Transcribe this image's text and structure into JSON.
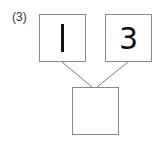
{
  "problem": {
    "label": "(3)",
    "top_left_value": "1",
    "top_right_value": "3",
    "bottom_value": ""
  },
  "colors": {
    "border": "#8a8a8a",
    "line": "#7a7a7a",
    "text": "#111111"
  }
}
